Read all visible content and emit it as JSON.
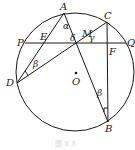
{
  "figure": {
    "caption": "图 X.X",
    "circle": {
      "cx": 75,
      "cy": 72,
      "r": 59
    },
    "center": {
      "label": "O",
      "x": 76,
      "y": 73
    },
    "points": {
      "A": {
        "label": "A",
        "x": 64,
        "y": 13
      },
      "C": {
        "label": "C",
        "x": 107,
        "y": 22
      },
      "P": {
        "label": "P",
        "x": 19,
        "y": 43
      },
      "Q": {
        "label": "Q",
        "x": 130,
        "y": 43
      },
      "E": {
        "label": "E",
        "x": 45,
        "y": 43
      },
      "M": {
        "label": "M",
        "x": 80,
        "y": 43
      },
      "F": {
        "label": "F",
        "x": 107,
        "y": 43
      },
      "D": {
        "label": "D",
        "x": 17,
        "y": 83
      },
      "B": {
        "label": "B",
        "x": 108,
        "y": 122
      }
    },
    "angles": {
      "alpha": "α",
      "delta": "δ",
      "gamma": "γ",
      "beta_d": "β",
      "beta_b": "β"
    },
    "segments": [
      "PQ",
      "AD",
      "AB",
      "DC",
      "CB"
    ]
  }
}
